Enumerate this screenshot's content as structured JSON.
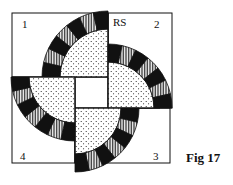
{
  "figure": {
    "caption": "Fig 17",
    "labels": {
      "q1": "1",
      "q2": "2",
      "q3": "3",
      "q4": "4",
      "rs": "RS"
    }
  },
  "colors": {
    "ink": "#111111",
    "paper": "#ffffff"
  }
}
